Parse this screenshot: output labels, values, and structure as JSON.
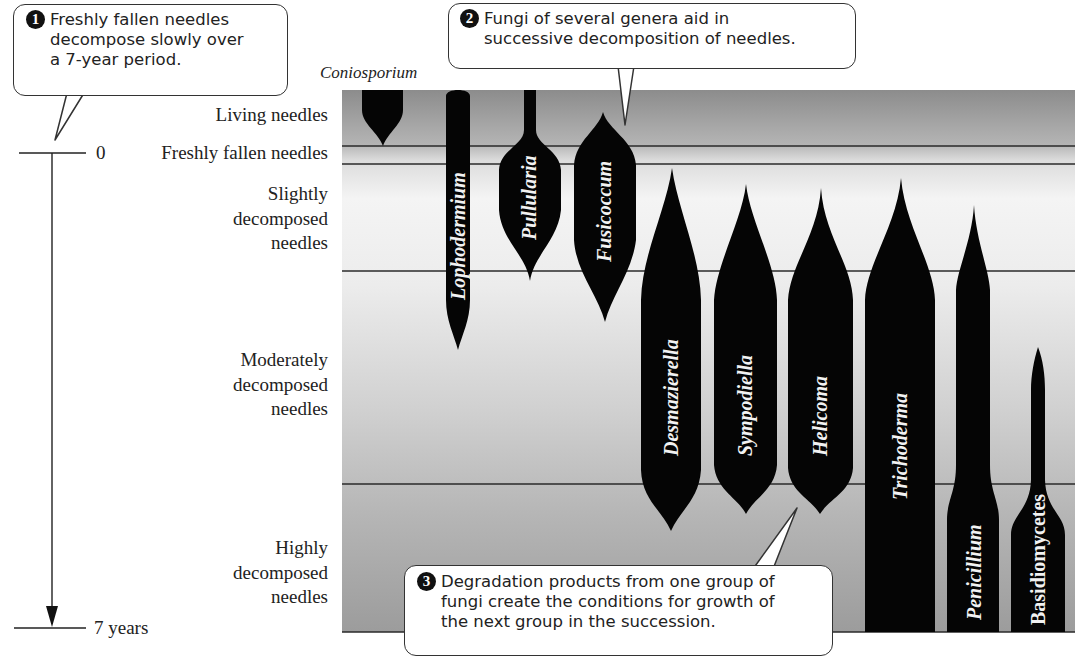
{
  "callouts": [
    {
      "number": "1",
      "lines": [
        "Freshly fallen needles",
        "decompose slowly over",
        "a 7-year period."
      ]
    },
    {
      "number": "2",
      "lines": [
        "Fungi of several genera aid in",
        "successive decomposition of needles."
      ]
    },
    {
      "number": "3",
      "lines": [
        "Degradation products from one group of",
        "fungi create the conditions for growth of",
        "the next group in the succession."
      ]
    }
  ],
  "time_axis": {
    "start_label": "0",
    "end_label": "7 years"
  },
  "stages": [
    {
      "lines": [
        "Living needles"
      ]
    },
    {
      "lines": [
        "Freshly fallen needles"
      ]
    },
    {
      "lines": [
        "Slightly",
        "decomposed",
        "needles"
      ]
    },
    {
      "lines": [
        "Moderately",
        "decomposed",
        "needles"
      ]
    },
    {
      "lines": [
        "Highly",
        "decomposed",
        "needles"
      ]
    }
  ],
  "genera": [
    {
      "name": "Coniosporium",
      "label_position": "above"
    },
    {
      "name": "Lophodermium"
    },
    {
      "name": "Pullularia"
    },
    {
      "name": "Fusicoccum"
    },
    {
      "name": "Desmazierella"
    },
    {
      "name": "Sympodiella"
    },
    {
      "name": "Helicoma"
    },
    {
      "name": "Trichoderma"
    },
    {
      "name": "Penicillium"
    },
    {
      "name": "Basidiomycetes"
    }
  ],
  "colors": {
    "fungus_fill": "#050505",
    "band_top": "#8f8f8f",
    "band_light": "#f3f3f3",
    "band_bottom": "#9a9a9a",
    "band_line": "#2a2a2a"
  }
}
